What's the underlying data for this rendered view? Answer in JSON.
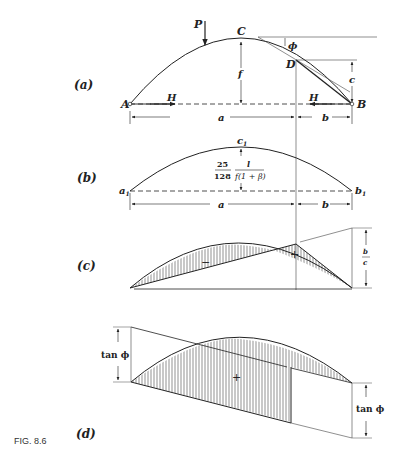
{
  "figure": {
    "caption": "FIG. 8.6",
    "panels": {
      "a": {
        "label": "(a)",
        "points": {
          "A": "A",
          "B": "B",
          "C": "C",
          "D": "D"
        },
        "load": "P",
        "thrust_left": "H",
        "thrust_right": "H",
        "rise": "f",
        "drop": "c",
        "angle": "ϕ",
        "span_a": "a",
        "span_b": "b"
      },
      "b": {
        "label": "(b)",
        "points": {
          "a1": "a",
          "a1_sub": "1",
          "b1": "b",
          "b1_sub": "1",
          "c1": "c",
          "c1_sub": "1"
        },
        "ordinate_num1": "25",
        "ordinate_den1": "128",
        "ordinate_num2": "l",
        "ordinate_den2": "f(1 + β)",
        "span_a": "a",
        "span_b": "b"
      },
      "c": {
        "label": "(c)",
        "minus_sign": "−",
        "plus_sign": "+",
        "ratio_num": "b",
        "ratio_den": "c"
      },
      "d": {
        "label": "(d)",
        "plus_sign": "+",
        "left_ordinate": "tan ϕ",
        "right_ordinate": "tan ϕ"
      }
    }
  }
}
